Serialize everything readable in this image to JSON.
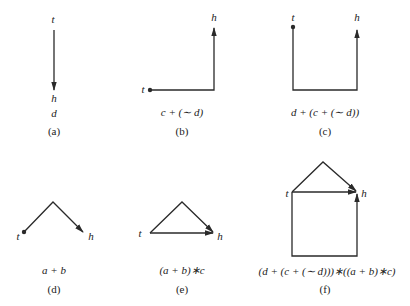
{
  "panels": [
    {
      "id": "a",
      "caption": "(a)",
      "expression": "d",
      "tail_label": "t",
      "head_label": "h"
    },
    {
      "id": "b",
      "caption": "(b)",
      "expression": "c + (∼ d)",
      "tail_label": "t",
      "head_label": "h"
    },
    {
      "id": "c",
      "caption": "(c)",
      "expression": "d + (c + (∼ d))",
      "tail_label": "t",
      "head_label": "h"
    },
    {
      "id": "d",
      "caption": "(d)",
      "expression": "a + b",
      "tail_label": "t",
      "head_label": "h"
    },
    {
      "id": "e",
      "caption": "(e)",
      "expression": "(a + b)∗c",
      "tail_label": "t",
      "head_label": "h"
    },
    {
      "id": "f",
      "caption": "(f)",
      "expression": "(d + (c + (∼ d)))∗((a + b)∗c)",
      "tail_label": "t",
      "head_label": "h"
    }
  ],
  "colors": {
    "stroke": "#2a2a2a",
    "text": "#222222",
    "background": "#ffffff"
  }
}
